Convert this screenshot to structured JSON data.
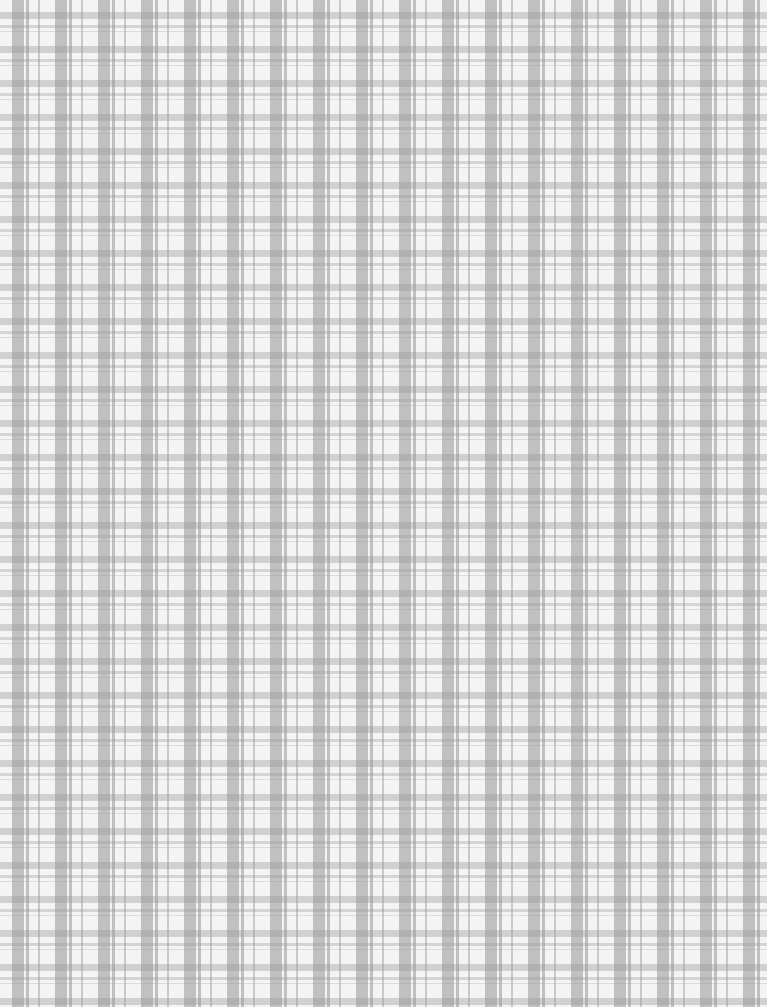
{
  "image": {
    "description": "Gray and white gingham / plaid fabric texture",
    "pattern_type": "gingham plaid",
    "colors": {
      "base": "#f4f4f4",
      "stripe": "#969696"
    }
  }
}
